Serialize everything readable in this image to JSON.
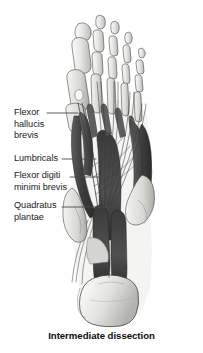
{
  "figure": {
    "caption": "Intermediate dissection",
    "view": "plantar view of right foot, intermediate layer",
    "background_color": "#ffffff"
  },
  "labels": [
    {
      "id": "flexor-hallucis-brevis",
      "text": "Flexor\nhallucis\nbrevis",
      "lines": [
        "Flexor",
        "hallucis",
        "brevis"
      ],
      "leader": {
        "x1": 47,
        "y1": 113,
        "x2": 78,
        "y2": 113
      }
    },
    {
      "id": "lumbricals",
      "text": "Lumbricals",
      "lines": [
        "Lumbricals"
      ],
      "leader": {
        "x1": 62,
        "y1": 159,
        "x2": 96,
        "y2": 159
      }
    },
    {
      "id": "flexor-digiti-minimi-brevis",
      "text": "Flexor digiti\nminimi brevis",
      "lines": [
        "Flexor digiti",
        "minimi brevis"
      ],
      "leader": {
        "x1": 70,
        "y1": 177,
        "x2": 101,
        "y2": 177
      }
    },
    {
      "id": "quadratus-plantae",
      "text": "Quadratus\nplantae",
      "lines": [
        "Quadratus",
        "plantae"
      ],
      "leader": {
        "x1": 62,
        "y1": 207,
        "x2": 112,
        "y2": 207
      }
    }
  ],
  "palette": {
    "bone_light": "#e8e8e6",
    "bone_mid": "#cfcfcc",
    "bone_shadow": "#aeaeab",
    "muscle_dark": "#4a4a4a",
    "muscle_darker": "#343434",
    "muscle_mid": "#6b6b6b",
    "tendon": "#f0f0ee",
    "outline": "#2b2b2b",
    "leader_line": "#4a4a4a",
    "text": "#1a1a1a"
  }
}
